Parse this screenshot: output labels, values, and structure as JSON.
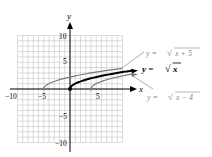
{
  "chart_data": {
    "type": "line",
    "title": "",
    "xlabel": "x",
    "ylabel": "y",
    "xlim": [
      -10,
      10
    ],
    "ylim": [
      -10,
      10
    ],
    "grid": true,
    "x_ticks": [
      -10,
      -5,
      5
    ],
    "y_ticks": [
      10,
      5,
      -5,
      -10
    ],
    "series": [
      {
        "name": "y = √(x + 5)",
        "color": "#808080",
        "start": [
          -5,
          0
        ],
        "end": [
          10,
          3.873
        ]
      },
      {
        "name": "y = √x",
        "color": "#000000",
        "start": [
          0,
          0
        ],
        "end": [
          12,
          3.464
        ]
      },
      {
        "name": "y = √(x − 4)",
        "color": "#808080",
        "start": [
          4,
          0
        ],
        "end": [
          12,
          2.828
        ]
      }
    ]
  },
  "axes": {
    "x_label": "x",
    "y_label": "y",
    "ticks": {
      "x_neg10": "−10",
      "x_neg5": "−5",
      "x_5": "5",
      "y_10": "10",
      "y_5": "5",
      "y_neg5": "−5",
      "y_neg10": "−10"
    }
  },
  "legend": {
    "shift_left": "y = √x + 5",
    "base": "y = √x",
    "shift_right": "y = √x − 4"
  },
  "labels": {
    "shift_left_prefix": "y = ",
    "shift_left_radicand": "x + 5",
    "base_prefix": "y = ",
    "base_radicand": "x",
    "shift_right_prefix": "y = ",
    "shift_right_radicand": "x − 4",
    "sqrt_symbol": "√"
  }
}
